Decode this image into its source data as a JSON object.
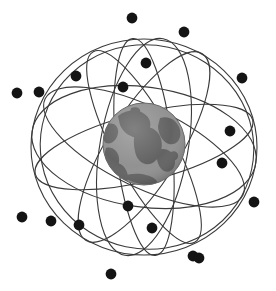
{
  "figure": {
    "title": "Global satellite constellation orbiting Earth",
    "caption": "Earth globe encircled by multiple inclined orbital rings carrying satellites",
    "background_color": "#ffffff"
  },
  "globe": {
    "name": "earth-globe",
    "center_x": 144,
    "center_y": 144,
    "radius": 41,
    "ocean_color": "#8e8e8e",
    "land_color": "#5e5e5e",
    "outline_color": "#6a6a6a"
  },
  "orbits": {
    "stroke_color": "#3a3a3a",
    "stroke_width": 1.1,
    "count": 9,
    "rings": [
      {
        "label": "orbit-ring-1",
        "cx": 144,
        "cy": 147,
        "rx": 113,
        "ry": 108,
        "rotation": 0
      },
      {
        "label": "orbit-ring-2",
        "cx": 144,
        "cy": 147,
        "rx": 113,
        "ry": 60,
        "rotation": 8
      },
      {
        "label": "orbit-ring-3",
        "cx": 144,
        "cy": 147,
        "rx": 112,
        "ry": 34,
        "rotation": -14
      },
      {
        "label": "orbit-ring-4",
        "cx": 144,
        "cy": 147,
        "rx": 110,
        "ry": 40,
        "rotation": 26
      },
      {
        "label": "orbit-ring-5",
        "cx": 144,
        "cy": 147,
        "rx": 108,
        "ry": 30,
        "rotation": 62
      },
      {
        "label": "orbit-ring-6",
        "cx": 144,
        "cy": 147,
        "rx": 110,
        "ry": 36,
        "rotation": -58
      },
      {
        "label": "orbit-ring-7",
        "cx": 144,
        "cy": 147,
        "rx": 109,
        "ry": 28,
        "rotation": 84
      },
      {
        "label": "orbit-ring-8",
        "cx": 144,
        "cy": 147,
        "rx": 110,
        "ry": 44,
        "rotation": -80
      },
      {
        "label": "orbit-ring-9",
        "cx": 147,
        "cy": 147,
        "rx": 107,
        "ry": 102,
        "rotation": 12
      }
    ]
  },
  "satellites": {
    "color": "#141414",
    "radius": 5.4,
    "count": 19,
    "points": [
      {
        "id": "satellite-01",
        "x": 132,
        "y": 18
      },
      {
        "id": "satellite-02",
        "x": 184,
        "y": 32
      },
      {
        "id": "satellite-03",
        "x": 146,
        "y": 63
      },
      {
        "id": "satellite-04",
        "x": 76,
        "y": 76
      },
      {
        "id": "satellite-05",
        "x": 242,
        "y": 78
      },
      {
        "id": "satellite-06",
        "x": 123,
        "y": 87
      },
      {
        "id": "satellite-07",
        "x": 17,
        "y": 93
      },
      {
        "id": "satellite-08",
        "x": 39,
        "y": 92
      },
      {
        "id": "satellite-09",
        "x": 230,
        "y": 131
      },
      {
        "id": "satellite-10",
        "x": 222,
        "y": 163
      },
      {
        "id": "satellite-11",
        "x": 128,
        "y": 206
      },
      {
        "id": "satellite-12",
        "x": 254,
        "y": 202
      },
      {
        "id": "satellite-13",
        "x": 22,
        "y": 217
      },
      {
        "id": "satellite-14",
        "x": 51,
        "y": 221
      },
      {
        "id": "satellite-15",
        "x": 79,
        "y": 225
      },
      {
        "id": "satellite-16",
        "x": 152,
        "y": 228
      },
      {
        "id": "satellite-17",
        "x": 193,
        "y": 256
      },
      {
        "id": "satellite-18",
        "x": 111,
        "y": 274
      },
      {
        "id": "satellite-19",
        "x": 199,
        "y": 258
      }
    ]
  },
  "continents": [
    {
      "id": "landmass-north",
      "d": "M 118 116 C 126 110 136 109 143 113 C 150 117 152 124 149 130 C 146 136 139 139 133 137 C 127 135 122 130 120 125 Z"
    },
    {
      "id": "landmass-northwest",
      "d": "M 108 124 C 114 122 119 127 118 133 C 117 140 111 145 106 143 C 102 141 103 132 108 124 Z"
    },
    {
      "id": "landmass-west",
      "d": "M 106 148 C 112 146 118 151 119 158 C 120 166 115 173 109 172 C 104 171 103 163 104 156 Z"
    },
    {
      "id": "landmass-southwest",
      "d": "M 115 163 C 121 162 127 168 128 176 C 129 182 124 184 119 181 C 114 178 112 169 115 163 Z"
    },
    {
      "id": "landmass-central",
      "d": "M 137 128 C 146 124 156 128 160 136 C 164 145 161 157 154 162 C 147 167 139 163 136 155 C 133 146 133 134 137 128 Z"
    },
    {
      "id": "landmass-east",
      "d": "M 160 118 C 169 115 178 121 180 130 C 182 139 176 146 169 144 C 162 142 158 133 158 126 Z"
    },
    {
      "id": "landmass-southeast",
      "d": "M 158 150 C 166 147 174 152 175 160 C 176 168 170 174 164 171 C 158 168 155 157 158 150 Z"
    },
    {
      "id": "landmass-polar-south",
      "d": "M 124 176 C 134 172 148 174 155 179 C 160 183 156 186 148 185 C 138 184 127 181 124 176 Z"
    },
    {
      "id": "landmass-island-a",
      "d": "M 171 152 C 175 150 179 153 178 157 C 177 161 172 162 170 159 Z"
    },
    {
      "id": "landmass-island-b",
      "d": "M 131 108 C 136 106 141 108 140 112 C 139 116 133 116 130 113 Z"
    }
  ]
}
